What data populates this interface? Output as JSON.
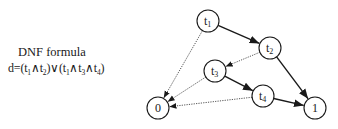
{
  "caption": {
    "title": "DNF formula",
    "formula_prefix": "d=",
    "formula_terms": [
      {
        "vars": [
          "t1",
          "t2"
        ]
      },
      {
        "vars": [
          "t1",
          "t3",
          "t4"
        ]
      }
    ],
    "formula_text": "d=(t1∧t2)∨(t1∧t3∧t4)"
  },
  "diagram": {
    "nodes": [
      {
        "id": "t1",
        "base": "t",
        "sub": "1",
        "x": 208,
        "y": 21
      },
      {
        "id": "t2",
        "base": "t",
        "sub": "2",
        "x": 270,
        "y": 48
      },
      {
        "id": "t3",
        "base": "t",
        "sub": "3",
        "x": 215,
        "y": 71
      },
      {
        "id": "t4",
        "base": "t",
        "sub": "4",
        "x": 263,
        "y": 96
      },
      {
        "id": "0",
        "base": "0",
        "sub": "",
        "x": 158,
        "y": 108
      },
      {
        "id": "1",
        "base": "1",
        "sub": "",
        "x": 315,
        "y": 108
      }
    ],
    "edges": [
      {
        "from": "t1",
        "to": "t2",
        "style": "solid"
      },
      {
        "from": "t1",
        "to": "0",
        "style": "dotted"
      },
      {
        "from": "t2",
        "to": "t3",
        "style": "dotted"
      },
      {
        "from": "t2",
        "to": "1",
        "style": "solid"
      },
      {
        "from": "t3",
        "to": "t4",
        "style": "solid"
      },
      {
        "from": "t3",
        "to": "0",
        "style": "dotted"
      },
      {
        "from": "t4",
        "to": "0",
        "style": "dotted"
      },
      {
        "from": "t4",
        "to": "1",
        "style": "solid"
      }
    ],
    "node_radius": 11,
    "colors": {
      "stroke": "#1a1a1a",
      "dotted": "#555555",
      "background": "#ffffff"
    }
  }
}
